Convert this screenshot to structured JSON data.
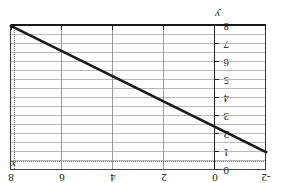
{
  "chart_data": {
    "type": "line",
    "title": "",
    "xlabel": "x",
    "ylabel": "y",
    "xlim": [
      -2,
      8
    ],
    "ylim": [
      0,
      8
    ],
    "x_ticks": [
      -2,
      0,
      2,
      4,
      6,
      8
    ],
    "x_tick_labels": [
      "-2",
      "0",
      "2",
      "4",
      "6",
      "8"
    ],
    "y_ticks": [
      0,
      1,
      2,
      3,
      4,
      5,
      6,
      7,
      8
    ],
    "y_tick_labels": [
      "0",
      "1",
      "2",
      "3",
      "4",
      "5",
      "6",
      "7",
      "8"
    ],
    "grid": true,
    "grid_minor_horizontal": true,
    "legend": "none",
    "orientation_note": "figure rendered rotated 180 degrees",
    "series": [
      {
        "name": "line",
        "x": [
          -2,
          8
        ],
        "y": [
          1.0,
          8.0
        ],
        "style": "solid",
        "color": "#1a1a1a",
        "width": 2.6
      }
    ],
    "guides": [
      {
        "name": "dotted-horizontal",
        "orientation": "horizontal",
        "value": 0.45,
        "style": "dotted",
        "color": "#6f6f6f"
      },
      {
        "name": "dotted-vertical",
        "orientation": "vertical",
        "value": 7.85,
        "style": "dotted",
        "color": "#6f6f6f"
      }
    ]
  },
  "axes": {
    "x_axis_label": "x",
    "y_axis_label": "y"
  },
  "colors": {
    "line": "#1a1a1a",
    "grid_minor": "#b9b9b9",
    "grid_major": "#9a9a9a",
    "axis": "#222222",
    "dotted_guide": "#6f6f6f",
    "background": "#ffffff"
  }
}
